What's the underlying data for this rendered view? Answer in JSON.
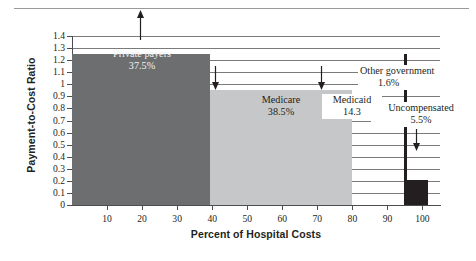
{
  "chart_data": {
    "type": "bar",
    "title": "",
    "xlabel": "Percent of Hospital Costs",
    "ylabel": "Payment-to-Cost Ratio",
    "xlim": [
      0,
      105
    ],
    "ylim": [
      0,
      1.4
    ],
    "grid": true,
    "legend": "none",
    "orientation": "variable-width-horizontal-segments",
    "xticks": [
      "10",
      "20",
      "30",
      "40",
      "50",
      "60",
      "70",
      "80",
      "90",
      "100"
    ],
    "xtick_values": [
      10,
      20,
      30,
      40,
      50,
      60,
      70,
      80,
      90,
      100
    ],
    "yticks": [
      "0",
      "0.1",
      "0.2",
      "0.3",
      "0.4",
      "0.5",
      "0.6",
      "0.7",
      "0.8",
      "0.9",
      "1",
      "1.1",
      "1.2",
      "1.3",
      "1.4"
    ],
    "ytick_values": [
      0,
      0.1,
      0.2,
      0.3,
      0.4,
      0.5,
      0.6,
      0.7,
      0.8,
      0.9,
      1.0,
      1.1,
      1.2,
      1.3,
      1.4
    ],
    "categories": [
      "Private payers",
      "Medicare",
      "Medicaid",
      "Other government",
      "Uncompensated"
    ],
    "values": [
      1.25,
      0.95,
      0.0,
      1.25,
      0.2
    ],
    "widths": [
      37.5,
      38.5,
      14.3,
      1.6,
      5.5
    ],
    "segments": [
      {
        "name": "Private payers",
        "label": "Private payers",
        "pct": "37.5%",
        "width_pct": 37.5,
        "x_start": 0,
        "x_end": 37.5,
        "ratio": 1.25,
        "color": "#6d6e70"
      },
      {
        "name": "Medicare",
        "label": "Medicare",
        "pct": "38.5%",
        "width_pct": 38.5,
        "x_start": 37.5,
        "x_end": 76.0,
        "ratio": 0.95,
        "color": "#c6c7c8"
      },
      {
        "name": "Medicaid",
        "label": "Medicaid",
        "pct": "14.3",
        "width_pct": 14.3,
        "x_start": 76.0,
        "x_end": 90.3,
        "ratio": 0.0,
        "color": "#ffffff"
      },
      {
        "name": "Other government",
        "label": "Other government",
        "pct": "1.6%",
        "width_pct": 1.6,
        "x_start": 90.3,
        "x_end": 91.9,
        "ratio": 1.25,
        "color": "#231f20"
      },
      {
        "name": "Uncompensated",
        "label": "Uncompensated",
        "pct": "5.5%",
        "width_pct": 5.5,
        "x_start": 91.9,
        "x_end": 97.4,
        "ratio": 0.2,
        "color": "#231f20"
      }
    ],
    "annotations": [
      {
        "name": "private-payers-arrow",
        "direction": "up"
      },
      {
        "name": "medicare-arrow",
        "direction": "down"
      },
      {
        "name": "medicaid-arrow",
        "direction": "down"
      },
      {
        "name": "uncompensated-arrow",
        "direction": "down"
      }
    ],
    "colors": {
      "private_payers": "#6d6e70",
      "medicare": "#c6c7c8",
      "other_government": "#231f20",
      "uncompensated": "#231f20",
      "gridline": "#7b7b7b",
      "axis": "#4d4d4d",
      "text": "#231f20"
    }
  }
}
